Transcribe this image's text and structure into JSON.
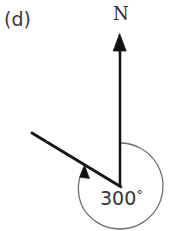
{
  "figure": {
    "part_label": "(d)",
    "north_label": "N",
    "angle_label": "300",
    "degree_symbol": "°",
    "background_color": "#ffffff",
    "line_color": "#1a1a1a",
    "arc_color": "#6b6b6b",
    "text_color": "#2e2e2e"
  },
  "diagram_data": {
    "type": "bearing-diagram",
    "description": "Bearing diagram showing a clockwise angle measured from North",
    "bearing_degrees": 300,
    "vertex": {
      "x": 120,
      "y": 186
    },
    "north_arrow": {
      "from": {
        "x": 120,
        "y": 186
      },
      "to": {
        "x": 120,
        "y": 34
      },
      "has_arrowhead": true,
      "arrowhead_at": "to",
      "direction_label": "N"
    },
    "bearing_ray": {
      "from": {
        "x": 120,
        "y": 186
      },
      "to": {
        "x": 32,
        "y": 133
      },
      "has_arrowhead": false,
      "bearing_from_north_clockwise": 300
    },
    "angle_arc": {
      "center": {
        "x": 120,
        "y": 186
      },
      "radius": 43,
      "start_angle_from_north_cw": 0,
      "end_angle_from_north_cw": 300,
      "sweep": "clockwise",
      "has_arrowhead_at_end": true,
      "label": "300°"
    }
  }
}
